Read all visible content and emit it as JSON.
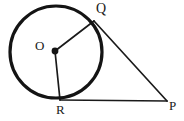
{
  "figure": {
    "kind": "geometry-diagram",
    "background_color": "#ffffff",
    "stroke_color": "#1a1a1a",
    "canvas": {
      "width": 184,
      "height": 121
    },
    "circle": {
      "label": "circle-O",
      "center_x": 56,
      "center_y": 52,
      "radius": 46,
      "stroke_width": 3.2,
      "stroke_color": "#141414",
      "fill": "none"
    },
    "center_dot": {
      "x": 55,
      "y": 51,
      "radius": 3.4,
      "color": "#141414"
    },
    "points": [
      {
        "id": "O",
        "label": "O",
        "x": 55,
        "y": 51,
        "role": "center",
        "label_x": 35,
        "label_y": 39
      },
      {
        "id": "Q",
        "label": "Q",
        "x": 94,
        "y": 21,
        "role": "tangent-point",
        "label_x": 96,
        "label_y": 2
      },
      {
        "id": "R",
        "label": "R",
        "x": 60,
        "y": 100,
        "role": "tangent-point",
        "label_x": 56,
        "label_y": 103
      },
      {
        "id": "P",
        "label": "P",
        "x": 167,
        "y": 101,
        "role": "external-point",
        "label_x": 169,
        "label_y": 99
      }
    ],
    "segments": [
      {
        "id": "OQ",
        "from": "O",
        "to": "Q",
        "x1": 55,
        "y1": 51,
        "x2": 94,
        "y2": 21,
        "stroke_width": 1.7,
        "kind": "radius"
      },
      {
        "id": "OR",
        "from": "O",
        "to": "R",
        "x1": 55,
        "y1": 51,
        "x2": 60,
        "y2": 100,
        "stroke_width": 1.7,
        "kind": "radius"
      },
      {
        "id": "QP",
        "from": "Q",
        "to": "P",
        "x1": 94,
        "y1": 21,
        "x2": 167,
        "y2": 101,
        "stroke_width": 1.7,
        "kind": "tangent"
      },
      {
        "id": "RP",
        "from": "R",
        "to": "P",
        "x1": 60,
        "y1": 100,
        "x2": 167,
        "y2": 101,
        "stroke_width": 1.7,
        "kind": "tangent"
      }
    ]
  }
}
